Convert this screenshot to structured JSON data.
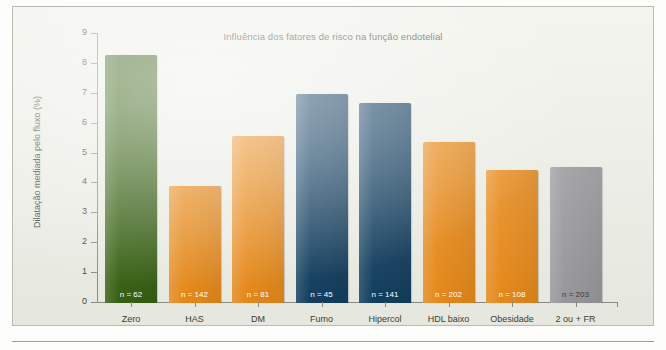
{
  "figure": {
    "title": "Influência dos fatores de risco na função endotelial",
    "ylabel": "Dilatação mediada pelo fluxo (%)"
  },
  "colors": {
    "green": "#335f0d",
    "orange": "#ec8a15",
    "navy": "#0d3b5e",
    "gray": "#9a9a9e",
    "panel_bg": "#eef0e7",
    "axis": "#8a8d82",
    "text": "#3b3f36"
  },
  "chart_data": {
    "type": "bar",
    "title": "Influência dos fatores de risco na função endotelial",
    "xlabel": "",
    "ylabel": "Dilatação mediada pelo fluxo (%)",
    "ylim": [
      0,
      9
    ],
    "yticks": [
      0,
      1,
      2,
      3,
      4,
      5,
      6,
      7,
      8,
      9
    ],
    "ytick_labels": [
      "0",
      "1",
      "2",
      "3",
      "4",
      "5",
      "6",
      "7",
      "8",
      "9"
    ],
    "grid": false,
    "legend": "none",
    "categories": [
      "Zero",
      "HAS",
      "DM",
      "Fumo",
      "Hipercol",
      "HDL baixo",
      "Obesidade",
      "2 ou + FR"
    ],
    "values": [
      8.3,
      3.9,
      5.6,
      7.0,
      6.7,
      5.4,
      4.45,
      4.55
    ],
    "bar_labels": [
      "n = 62",
      "n = 142",
      "n = 81",
      "n = 45",
      "n = 141",
      "n = 202",
      "n = 108",
      "n = 203"
    ],
    "bar_colors": [
      "#335f0d",
      "#ec8a15",
      "#ec8a15",
      "#0d3b5e",
      "#0d3b5e",
      "#ec8a15",
      "#ec8a15",
      "#9a9a9e"
    ],
    "bars": [
      {
        "category": "Zero",
        "value": 8.3,
        "n": 62,
        "label": "n = 62",
        "color": "#335f0d"
      },
      {
        "category": "HAS",
        "value": 3.9,
        "n": 142,
        "label": "n = 142",
        "color": "#ec8a15"
      },
      {
        "category": "DM",
        "value": 5.6,
        "n": 81,
        "label": "n = 81",
        "color": "#ec8a15"
      },
      {
        "category": "Fumo",
        "value": 7.0,
        "n": 45,
        "label": "n = 45",
        "color": "#0d3b5e"
      },
      {
        "category": "Hipercol",
        "value": 6.7,
        "n": 141,
        "label": "n = 141",
        "color": "#0d3b5e"
      },
      {
        "category": "HDL baixo",
        "value": 5.4,
        "n": 202,
        "label": "n = 202",
        "color": "#ec8a15"
      },
      {
        "category": "Obesidade",
        "value": 4.45,
        "n": 108,
        "label": "n = 108",
        "color": "#ec8a15"
      },
      {
        "category": "2 ou + FR",
        "value": 4.55,
        "n": 203,
        "label": "n = 203",
        "color": "#9a9a9e"
      }
    ]
  }
}
